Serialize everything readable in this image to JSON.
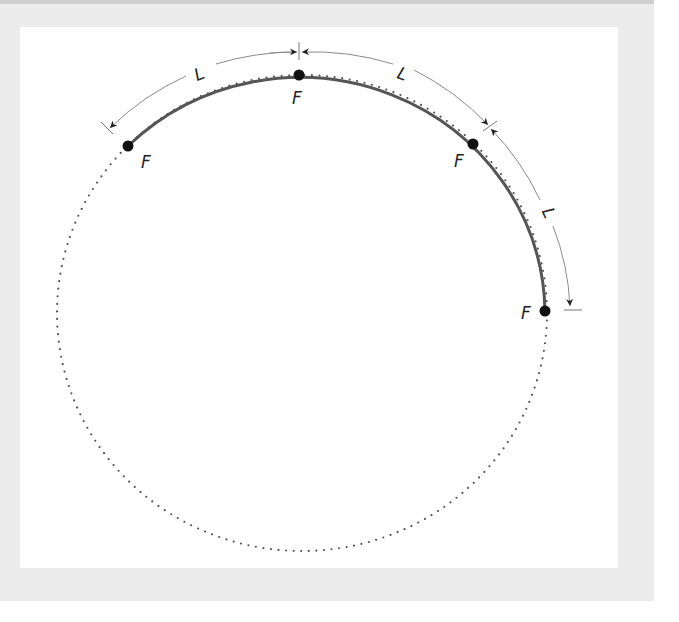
{
  "diagram": {
    "circle": {
      "cx": 302,
      "cy": 313,
      "rx": 245,
      "ry": 238,
      "style": "dotted"
    },
    "arc": {
      "color": "#555555",
      "stroke_width": 3
    },
    "dimension_arc": {
      "color": "#8a8a8a",
      "stroke_width": 1,
      "rx": 268,
      "ry": 261
    },
    "points": [
      {
        "label": "F",
        "x": 128,
        "y": 146,
        "label_x": 141,
        "label_y": 168
      },
      {
        "label": "F",
        "x": 299,
        "y": 75,
        "label_x": 292,
        "label_y": 104
      },
      {
        "label": "F",
        "x": 473,
        "y": 144,
        "label_x": 454,
        "label_y": 167
      },
      {
        "label": "F",
        "x": 545,
        "y": 311,
        "label_x": 521,
        "label_y": 319
      }
    ],
    "spacing_labels": [
      {
        "text": "L",
        "x": 199,
        "y": 80,
        "rotate": -22
      },
      {
        "text": "L",
        "x": 403,
        "y": 80,
        "rotate": 20
      },
      {
        "text": "L",
        "x": 549,
        "y": 220,
        "rotate": 65
      }
    ]
  },
  "colors": {
    "background": "#ececec",
    "panel": "#ffffff",
    "ink": "#222222"
  }
}
